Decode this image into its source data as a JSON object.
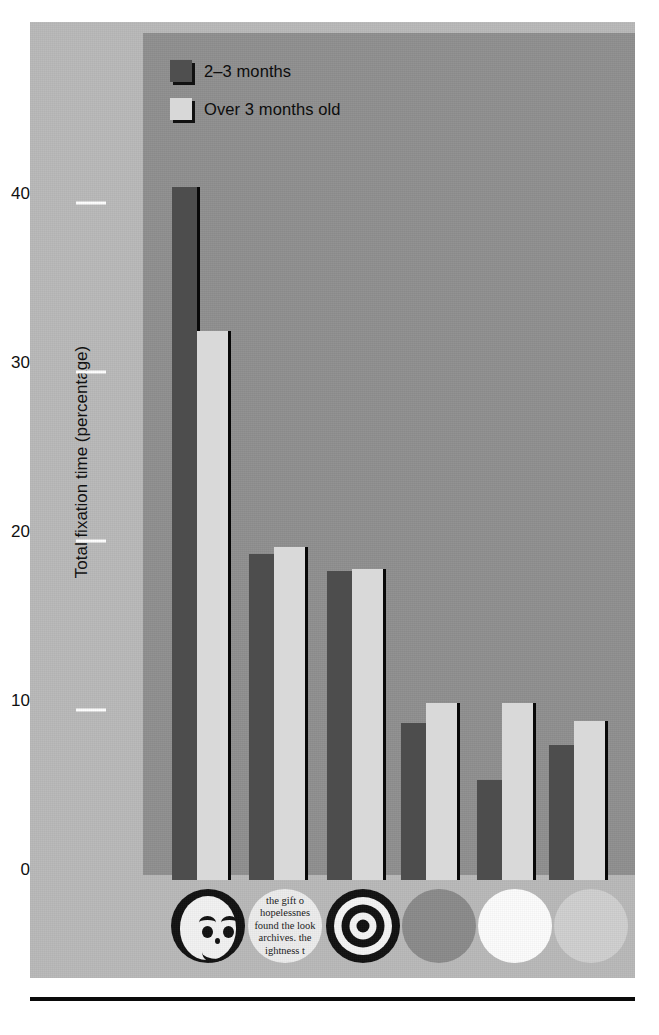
{
  "chart_data": {
    "type": "bar",
    "title": "",
    "subtitle": "",
    "xlabel": "",
    "ylabel": "Total fixation time (percentage)",
    "ylim": [
      0,
      44
    ],
    "yticks": [
      0,
      10,
      20,
      30,
      40
    ],
    "ytick_labels": [
      "0",
      "10",
      "20",
      "30",
      "40"
    ],
    "grid": false,
    "legend_position": "top-left-inside",
    "categories": [
      "face",
      "newsprint",
      "bullseye",
      "plain grey disc",
      "plain white disc",
      "plain light-grey disc"
    ],
    "series": [
      {
        "name": "2–3 months",
        "color": "#4d4d4d",
        "values": [
          41.0,
          19.3,
          18.3,
          9.3,
          5.9,
          8.0
        ]
      },
      {
        "name": "Over 3 months old",
        "color": "#d9d9d9",
        "values": [
          32.5,
          19.7,
          18.4,
          10.5,
          10.5,
          9.4
        ]
      }
    ]
  },
  "legend": {
    "items": [
      {
        "label": "2–3 months",
        "swatch": "dark"
      },
      {
        "label": "Over 3 months old",
        "swatch": "light"
      }
    ]
  },
  "axis": {
    "y_title": "Total fixation time (percentage)",
    "ticks": [
      "40",
      "30",
      "20",
      "10",
      "0"
    ]
  },
  "stimuli": {
    "newsprint_lines": [
      "the gift o",
      "hopelessnes",
      "found the look",
      "archives. the",
      "ightness t"
    ],
    "labels": [
      "face-stimulus",
      "newsprint-stimulus",
      "bullseye-stimulus",
      "grey-disc-stimulus",
      "white-disc-stimulus",
      "light-grey-disc-stimulus"
    ]
  },
  "colors": {
    "page_background": "#ffffff",
    "figure_background": "#b9b9b9",
    "plot_panel": "#8f8f8f",
    "series_dark": "#4d4d4d",
    "series_light": "#d9d9d9",
    "bar_edge": "#080808",
    "tick_mark": "#ffffff",
    "text": "#0d0d0d"
  }
}
